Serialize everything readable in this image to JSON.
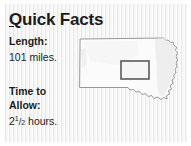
{
  "panel": {
    "title_prefix": "Q",
    "title_rest": "uick Facts",
    "background_color": "#f2f2f2",
    "frame_color": "#ffffff",
    "text_color": "#1c1c1c"
  },
  "facts": [
    {
      "label": "Length:",
      "value": "101 miles.",
      "name": "length"
    },
    {
      "label": "Time to\nAllow:",
      "value_whole": "2",
      "value_numerator": "1",
      "value_denominator": "2",
      "value_unit": " hours.",
      "name": "time-to-allow"
    }
  ],
  "map": {
    "state": "South Dakota",
    "outline_color": "#8c8c8c",
    "fill_color": "#fbfbfb",
    "shade_color": "#ebebeb",
    "highlight": {
      "label": "highlighted route region",
      "stroke_color": "#5a5a5a",
      "fill_color": "#f6f6f6",
      "x": 44,
      "y": 26,
      "width": 28,
      "height": 18
    }
  }
}
